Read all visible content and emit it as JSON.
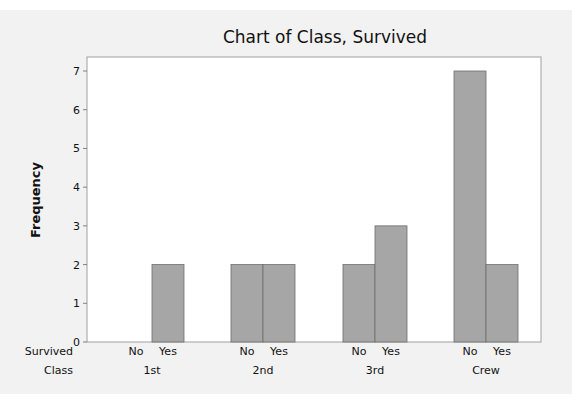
{
  "chart_data": {
    "type": "bar",
    "title": "Chart of Class, Survived",
    "xlabel": "",
    "ylabel": "Frequency",
    "ylim": [
      0,
      7.3
    ],
    "yticks": [
      0,
      1,
      2,
      3,
      4,
      5,
      6,
      7
    ],
    "grid": false,
    "legend": "none",
    "bar_color": "#a6a6a6",
    "row_labels": {
      "inner": "Survived",
      "outer": "Class"
    },
    "groups": [
      {
        "class": "1st",
        "bars": [
          {
            "survived": "No",
            "value": 0
          },
          {
            "survived": "Yes",
            "value": 2
          }
        ]
      },
      {
        "class": "2nd",
        "bars": [
          {
            "survived": "No",
            "value": 2
          },
          {
            "survived": "Yes",
            "value": 2
          }
        ]
      },
      {
        "class": "3rd",
        "bars": [
          {
            "survived": "No",
            "value": 2
          },
          {
            "survived": "Yes",
            "value": 3
          }
        ]
      },
      {
        "class": "Crew",
        "bars": [
          {
            "survived": "No",
            "value": 7
          },
          {
            "survived": "Yes",
            "value": 2
          }
        ]
      }
    ]
  }
}
